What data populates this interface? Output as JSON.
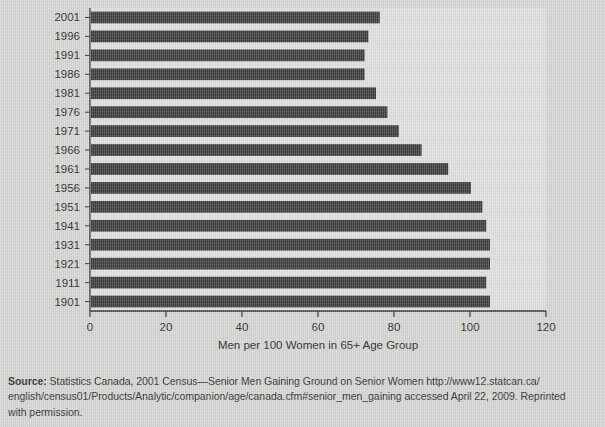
{
  "chart_data": {
    "type": "bar",
    "orientation": "horizontal",
    "title": "",
    "xlabel": "Men per 100  Women in 65+ Age Group",
    "ylabel": "",
    "categories": [
      "2001",
      "1996",
      "1991",
      "1986",
      "1981",
      "1976",
      "1971",
      "1966",
      "1961",
      "1956",
      "1951",
      "1941",
      "1931",
      "1921",
      "1911",
      "1901"
    ],
    "values": [
      76,
      73,
      72,
      72,
      75,
      78,
      81,
      87,
      94,
      100,
      103,
      104,
      105,
      105,
      104,
      105
    ],
    "xlim": [
      0,
      120
    ],
    "xticks": [
      0,
      20,
      40,
      60,
      80,
      100,
      120
    ],
    "xtick_labels": [
      "0",
      "20",
      "40",
      "60",
      "80",
      "100",
      "120"
    ],
    "ylim_categories": 16,
    "grid": false,
    "legend": false,
    "bar_color": "#3c3c3c",
    "plot_background": "#dedede",
    "axis_color": "#2b2b2b"
  },
  "axis": {
    "x_title": "Men per 100  Women in 65+ Age Group"
  },
  "source": {
    "label": "Source:",
    "line1_rest": " Statistics Canada, 2001 Census—Senior Men Gaining Ground on Senior Women http://www12.statcan.ca/",
    "line2": "english/census01/Products/Analytic/companion/age/canada.cfm#senior_men_gaining accessed April 22, 2009. Reprinted",
    "line3": "with permission."
  },
  "colors": {
    "page_background": "#d4d4d2",
    "bar": "#3c3c3c",
    "text": "#262626"
  }
}
